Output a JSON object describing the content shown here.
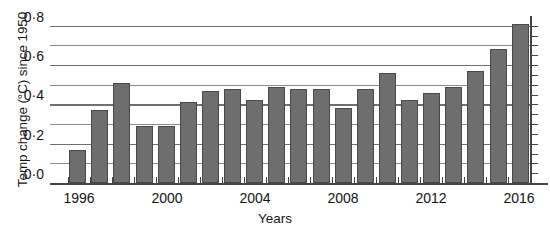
{
  "chart_data": {
    "type": "bar",
    "title": "",
    "xlabel": "Years",
    "ylabel": "Temp change (°C) since 1950",
    "ylim": [
      0.0,
      0.85
    ],
    "xlim": [
      1995.5,
      2016.5
    ],
    "grid": true,
    "grid_interval": 0.1,
    "legend": "none",
    "bar_color": "#6e6e6e",
    "bar_edge_color": "#4a4a4a",
    "categories": [
      "1996",
      "1997",
      "1998",
      "1999",
      "2000",
      "2001",
      "2002",
      "2003",
      "2004",
      "2005",
      "2006",
      "2007",
      "2008",
      "2009",
      "2010",
      "2011",
      "2012",
      "2013",
      "2014",
      "2015",
      "2016"
    ],
    "values": [
      0.17,
      0.37,
      0.51,
      0.29,
      0.29,
      0.41,
      0.47,
      0.48,
      0.42,
      0.49,
      0.48,
      0.48,
      0.38,
      0.48,
      0.56,
      0.42,
      0.46,
      0.49,
      0.57,
      0.68,
      0.81
    ],
    "y_tick_labels": [
      "0·0",
      "0·2",
      "0·4",
      "0·6",
      "0·8"
    ],
    "y_tick_values": [
      0.0,
      0.2,
      0.4,
      0.6,
      0.8
    ],
    "y_minor_values": [
      0.1,
      0.3,
      0.5,
      0.7
    ],
    "x_tick_labels": [
      "1996",
      "2000",
      "2004",
      "2008",
      "2012",
      "2016"
    ],
    "x_tick_values": [
      1996,
      2000,
      2004,
      2008,
      2012,
      2016
    ]
  }
}
